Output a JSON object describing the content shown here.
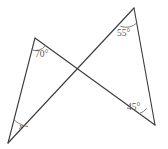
{
  "figure": {
    "type": "geometry-diagram",
    "background_color": "#ffffff",
    "stroke_color": "#3a3a3a",
    "label_color": "#555555",
    "arc_color": "#6e6e6e",
    "canvas": {
      "width": 168,
      "height": 149
    },
    "vertices": [
      {
        "name": "top-left",
        "x": 35,
        "y": 38
      },
      {
        "name": "bottom-left",
        "x": 8,
        "y": 143
      },
      {
        "name": "top-right-apex",
        "x": 134,
        "y": 8
      },
      {
        "name": "bottom-right",
        "x": 155,
        "y": 125
      },
      {
        "name": "crossing-point",
        "x": 79,
        "y": 68
      }
    ],
    "segments": [
      {
        "name": "left-triangle-left-edge",
        "from": "top-left",
        "to": "bottom-left"
      },
      {
        "name": "left-triangle-long-edge",
        "from": "top-left",
        "to": "bottom-right"
      },
      {
        "name": "right-triangle-long-edge",
        "from": "bottom-left",
        "to": "top-right-apex"
      },
      {
        "name": "right-triangle-right-edge",
        "from": "top-right-apex",
        "to": "bottom-right"
      }
    ],
    "angles": [
      {
        "name": "angle-top-left",
        "label": "70°",
        "at_vertex": "top-left",
        "label_x": 35,
        "label_y": 57
      },
      {
        "name": "angle-top-right",
        "label": "55°",
        "at_vertex": "top-right-apex",
        "label_x": 117,
        "label_y": 36
      },
      {
        "name": "angle-bottom-right",
        "label": "45°",
        "at_vertex": "bottom-right",
        "label_x": 127,
        "label_y": 110
      },
      {
        "name": "angle-bottom-left",
        "label": "x",
        "at_vertex": "bottom-left",
        "label_x": 19,
        "label_y": 129
      }
    ]
  }
}
